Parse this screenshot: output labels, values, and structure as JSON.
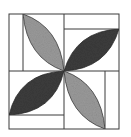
{
  "diagram": {
    "type": "quilt-block",
    "colors": {
      "background": "#ffffff",
      "outline": "#3a3a3a",
      "light_petal": "#9a9a9a",
      "dark_petal": "#3c3c3c"
    },
    "outer_square": {
      "x": 9,
      "y": 14,
      "width": 110,
      "height": 115
    },
    "center": {
      "x": 64,
      "y": 71
    },
    "petals": [
      {
        "id": "top-left",
        "shade": "light"
      },
      {
        "id": "top-right",
        "shade": "dark"
      },
      {
        "id": "bottom-left",
        "shade": "dark"
      },
      {
        "id": "bottom-right",
        "shade": "light"
      }
    ]
  }
}
